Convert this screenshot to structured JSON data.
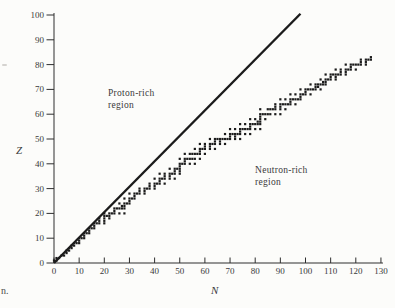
{
  "figure": {
    "background": "#fcfcfa",
    "ink_color": "#1b1b1b",
    "text_color": "#3a3a3a",
    "region_labels": {
      "proton": {
        "line1": "Proton-rich",
        "line2": "region"
      },
      "neutron": {
        "line1": "Neutron-rich",
        "line2": "region"
      }
    },
    "caption_fragment": "n."
  },
  "chart_data": {
    "type": "scatter",
    "title": "",
    "xlabel": "N",
    "ylabel": "Z",
    "xlim": [
      0,
      130
    ],
    "ylim": [
      0,
      100
    ],
    "xticks": [
      0,
      10,
      20,
      30,
      40,
      50,
      60,
      70,
      80,
      90,
      100,
      110,
      120,
      130
    ],
    "yticks": [
      0,
      10,
      20,
      30,
      40,
      50,
      60,
      70,
      80,
      90,
      100
    ],
    "grid": false,
    "legend": "none",
    "stability_line": {
      "label": "Z = N line",
      "x": [
        0,
        98
      ],
      "y": [
        0,
        100.5
      ]
    },
    "series": [
      {
        "name": "stable nuclides (N, Z)",
        "marker": "square",
        "points": [
          [
            0,
            1
          ],
          [
            1,
            1
          ],
          [
            1,
            2
          ],
          [
            2,
            2
          ],
          [
            3,
            3
          ],
          [
            4,
            3
          ],
          [
            5,
            4
          ],
          [
            5,
            5
          ],
          [
            6,
            5
          ],
          [
            6,
            6
          ],
          [
            7,
            6
          ],
          [
            7,
            7
          ],
          [
            8,
            7
          ],
          [
            8,
            8
          ],
          [
            9,
            8
          ],
          [
            10,
            8
          ],
          [
            10,
            9
          ],
          [
            10,
            10
          ],
          [
            11,
            10
          ],
          [
            12,
            10
          ],
          [
            12,
            11
          ],
          [
            12,
            12
          ],
          [
            13,
            12
          ],
          [
            14,
            12
          ],
          [
            14,
            13
          ],
          [
            14,
            14
          ],
          [
            15,
            14
          ],
          [
            16,
            14
          ],
          [
            16,
            15
          ],
          [
            16,
            16
          ],
          [
            17,
            16
          ],
          [
            18,
            16
          ],
          [
            20,
            16
          ],
          [
            18,
            17
          ],
          [
            20,
            17
          ],
          [
            18,
            18
          ],
          [
            20,
            18
          ],
          [
            22,
            18
          ],
          [
            20,
            19
          ],
          [
            21,
            19
          ],
          [
            22,
            19
          ],
          [
            20,
            20
          ],
          [
            22,
            20
          ],
          [
            23,
            20
          ],
          [
            24,
            20
          ],
          [
            26,
            20
          ],
          [
            28,
            20
          ],
          [
            24,
            21
          ],
          [
            24,
            22
          ],
          [
            25,
            22
          ],
          [
            26,
            22
          ],
          [
            27,
            22
          ],
          [
            28,
            22
          ],
          [
            27,
            23
          ],
          [
            28,
            23
          ],
          [
            26,
            24
          ],
          [
            28,
            24
          ],
          [
            29,
            24
          ],
          [
            30,
            24
          ],
          [
            30,
            25
          ],
          [
            28,
            26
          ],
          [
            30,
            26
          ],
          [
            31,
            26
          ],
          [
            32,
            26
          ],
          [
            32,
            27
          ],
          [
            30,
            28
          ],
          [
            32,
            28
          ],
          [
            33,
            28
          ],
          [
            34,
            28
          ],
          [
            36,
            28
          ],
          [
            34,
            29
          ],
          [
            36,
            29
          ],
          [
            34,
            30
          ],
          [
            36,
            30
          ],
          [
            37,
            30
          ],
          [
            38,
            30
          ],
          [
            40,
            30
          ],
          [
            38,
            31
          ],
          [
            40,
            31
          ],
          [
            38,
            32
          ],
          [
            40,
            32
          ],
          [
            41,
            32
          ],
          [
            42,
            32
          ],
          [
            44,
            32
          ],
          [
            42,
            33
          ],
          [
            40,
            34
          ],
          [
            42,
            34
          ],
          [
            43,
            34
          ],
          [
            44,
            34
          ],
          [
            46,
            34
          ],
          [
            48,
            34
          ],
          [
            44,
            35
          ],
          [
            46,
            35
          ],
          [
            42,
            36
          ],
          [
            44,
            36
          ],
          [
            46,
            36
          ],
          [
            47,
            36
          ],
          [
            48,
            36
          ],
          [
            50,
            36
          ],
          [
            48,
            37
          ],
          [
            50,
            37
          ],
          [
            46,
            38
          ],
          [
            48,
            38
          ],
          [
            49,
            38
          ],
          [
            50,
            38
          ],
          [
            50,
            39
          ],
          [
            50,
            40
          ],
          [
            51,
            40
          ],
          [
            52,
            40
          ],
          [
            54,
            40
          ],
          [
            56,
            40
          ],
          [
            52,
            41
          ],
          [
            50,
            42
          ],
          [
            52,
            42
          ],
          [
            53,
            42
          ],
          [
            54,
            42
          ],
          [
            55,
            42
          ],
          [
            56,
            42
          ],
          [
            58,
            42
          ],
          [
            52,
            44
          ],
          [
            54,
            44
          ],
          [
            55,
            44
          ],
          [
            56,
            44
          ],
          [
            57,
            44
          ],
          [
            58,
            44
          ],
          [
            60,
            44
          ],
          [
            58,
            45
          ],
          [
            56,
            46
          ],
          [
            58,
            46
          ],
          [
            59,
            46
          ],
          [
            60,
            46
          ],
          [
            62,
            46
          ],
          [
            64,
            46
          ],
          [
            60,
            47
          ],
          [
            62,
            47
          ],
          [
            58,
            48
          ],
          [
            60,
            48
          ],
          [
            62,
            48
          ],
          [
            63,
            48
          ],
          [
            64,
            48
          ],
          [
            66,
            48
          ],
          [
            68,
            48
          ],
          [
            64,
            49
          ],
          [
            66,
            49
          ],
          [
            62,
            50
          ],
          [
            64,
            50
          ],
          [
            65,
            50
          ],
          [
            66,
            50
          ],
          [
            67,
            50
          ],
          [
            68,
            50
          ],
          [
            69,
            50
          ],
          [
            70,
            50
          ],
          [
            72,
            50
          ],
          [
            74,
            50
          ],
          [
            70,
            51
          ],
          [
            72,
            51
          ],
          [
            68,
            52
          ],
          [
            70,
            52
          ],
          [
            71,
            52
          ],
          [
            72,
            52
          ],
          [
            73,
            52
          ],
          [
            74,
            52
          ],
          [
            76,
            52
          ],
          [
            78,
            52
          ],
          [
            74,
            53
          ],
          [
            70,
            54
          ],
          [
            72,
            54
          ],
          [
            74,
            54
          ],
          [
            75,
            54
          ],
          [
            76,
            54
          ],
          [
            77,
            54
          ],
          [
            78,
            54
          ],
          [
            80,
            54
          ],
          [
            82,
            54
          ],
          [
            78,
            55
          ],
          [
            74,
            56
          ],
          [
            76,
            56
          ],
          [
            78,
            56
          ],
          [
            79,
            56
          ],
          [
            80,
            56
          ],
          [
            81,
            56
          ],
          [
            82,
            56
          ],
          [
            81,
            57
          ],
          [
            82,
            57
          ],
          [
            78,
            58
          ],
          [
            80,
            58
          ],
          [
            82,
            58
          ],
          [
            84,
            58
          ],
          [
            82,
            59
          ],
          [
            82,
            60
          ],
          [
            83,
            60
          ],
          [
            84,
            60
          ],
          [
            85,
            60
          ],
          [
            86,
            60
          ],
          [
            88,
            60
          ],
          [
            90,
            60
          ],
          [
            82,
            62
          ],
          [
            85,
            62
          ],
          [
            86,
            62
          ],
          [
            87,
            62
          ],
          [
            88,
            62
          ],
          [
            90,
            62
          ],
          [
            92,
            62
          ],
          [
            88,
            63
          ],
          [
            90,
            63
          ],
          [
            88,
            64
          ],
          [
            90,
            64
          ],
          [
            91,
            64
          ],
          [
            92,
            64
          ],
          [
            93,
            64
          ],
          [
            94,
            64
          ],
          [
            96,
            64
          ],
          [
            94,
            65
          ],
          [
            90,
            66
          ],
          [
            92,
            66
          ],
          [
            94,
            66
          ],
          [
            95,
            66
          ],
          [
            96,
            66
          ],
          [
            97,
            66
          ],
          [
            98,
            66
          ],
          [
            98,
            67
          ],
          [
            94,
            68
          ],
          [
            96,
            68
          ],
          [
            98,
            68
          ],
          [
            99,
            68
          ],
          [
            100,
            68
          ],
          [
            102,
            68
          ],
          [
            100,
            69
          ],
          [
            98,
            70
          ],
          [
            100,
            70
          ],
          [
            101,
            70
          ],
          [
            102,
            70
          ],
          [
            103,
            70
          ],
          [
            104,
            70
          ],
          [
            106,
            70
          ],
          [
            104,
            71
          ],
          [
            105,
            71
          ],
          [
            102,
            72
          ],
          [
            104,
            72
          ],
          [
            105,
            72
          ],
          [
            106,
            72
          ],
          [
            107,
            72
          ],
          [
            108,
            72
          ],
          [
            107,
            73
          ],
          [
            108,
            73
          ],
          [
            106,
            74
          ],
          [
            108,
            74
          ],
          [
            109,
            74
          ],
          [
            110,
            74
          ],
          [
            112,
            74
          ],
          [
            110,
            75
          ],
          [
            112,
            75
          ],
          [
            108,
            76
          ],
          [
            110,
            76
          ],
          [
            111,
            76
          ],
          [
            112,
            76
          ],
          [
            113,
            76
          ],
          [
            114,
            76
          ],
          [
            116,
            76
          ],
          [
            114,
            77
          ],
          [
            116,
            77
          ],
          [
            112,
            78
          ],
          [
            114,
            78
          ],
          [
            116,
            78
          ],
          [
            117,
            78
          ],
          [
            118,
            78
          ],
          [
            120,
            78
          ],
          [
            118,
            79
          ],
          [
            116,
            80
          ],
          [
            118,
            80
          ],
          [
            119,
            80
          ],
          [
            120,
            80
          ],
          [
            121,
            80
          ],
          [
            122,
            80
          ],
          [
            124,
            80
          ],
          [
            122,
            81
          ],
          [
            124,
            81
          ],
          [
            122,
            82
          ],
          [
            124,
            82
          ],
          [
            125,
            82
          ],
          [
            126,
            82
          ],
          [
            126,
            83
          ]
        ]
      }
    ]
  }
}
